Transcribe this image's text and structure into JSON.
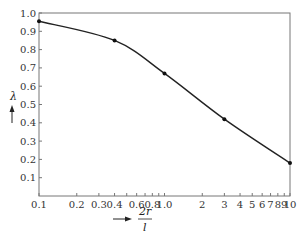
{
  "chart_data": {
    "type": "line",
    "title": "",
    "xlabel": "2r/l",
    "xlabel_numerator": "2r",
    "xlabel_denominator": "l",
    "ylabel": "λ",
    "x_scale": "log",
    "xlim": [
      0.1,
      10
    ],
    "ylim": [
      0,
      1.0
    ],
    "grid": false,
    "legend": null,
    "x_ticks": [
      0.1,
      0.2,
      0.3,
      0.4,
      0.5,
      0.6,
      0.7,
      0.8,
      0.9,
      1.0,
      2,
      3,
      4,
      5,
      6,
      7,
      8,
      9,
      10
    ],
    "x_tick_labels": [
      "0.1",
      "0.2",
      "0.3",
      "0.4",
      "",
      "0.6",
      "",
      "0.8",
      "",
      "1.0",
      "2",
      "3",
      "4",
      "5",
      "6",
      "7",
      "8",
      "9",
      "10"
    ],
    "y_ticks": [
      0.1,
      0.2,
      0.3,
      0.4,
      0.5,
      0.6,
      0.7,
      0.8,
      0.9,
      1.0
    ],
    "y_tick_labels": [
      "0.1",
      "0.2",
      "0.3",
      "0.4",
      "0.5",
      "0.6",
      "0.7",
      "0.8",
      "0.9",
      "1.0"
    ],
    "series": [
      {
        "name": "λ",
        "x": [
          0.1,
          0.4,
          1.0,
          3,
          10
        ],
        "values": [
          0.955,
          0.85,
          0.67,
          0.42,
          0.18
        ],
        "markers": true
      }
    ]
  }
}
